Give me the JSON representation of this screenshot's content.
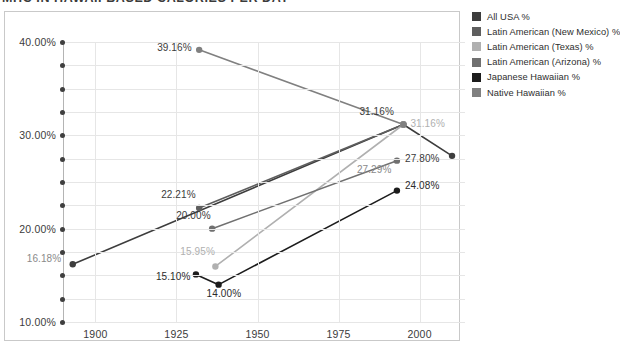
{
  "chart_title": "MHC IN HAWAII BASED CALORIES PER DAY",
  "legend": {
    "position": "right",
    "items": [
      {
        "label": "All USA %",
        "color": "#3d3d3d"
      },
      {
        "label": "Latin American (New Mexico) %",
        "color": "#5e5e5e"
      },
      {
        "label": "Latin American (Texas) %",
        "color": "#b0b0b0"
      },
      {
        "label": "Latin American (Arizona) %",
        "color": "#707070"
      },
      {
        "label": "Japanese Hawaiian %",
        "color": "#1c1c1c"
      },
      {
        "label": "Native Hawaiian %",
        "color": "#808080"
      }
    ]
  },
  "axes": {
    "y_ticks": [
      "10.00%",
      "20.00%",
      "30.00%",
      "40.00%"
    ],
    "y_tick_values": [
      10,
      20,
      30,
      40
    ],
    "x_ticks": [
      "1900",
      "1925",
      "1950",
      "1975",
      "2000"
    ],
    "x_tick_values": [
      1900,
      1925,
      1950,
      1975,
      2000
    ],
    "ylim": [
      10,
      40
    ],
    "xlim": [
      1890,
      2014
    ],
    "ylabel": "",
    "xlabel": ""
  },
  "chart_data": {
    "type": "line",
    "title": "MHC IN HAWAII BASED CALORIES PER DAY",
    "xlabel": "",
    "ylabel": "",
    "xlim": [
      1890,
      2014
    ],
    "ylim": [
      10,
      40
    ],
    "grid": true,
    "legend_position": "right",
    "series": [
      {
        "name": "All USA %",
        "color": "#3d3d3d",
        "points": [
          {
            "x": 1893,
            "y": 16.18,
            "label": "16.18%"
          },
          {
            "x": 1995,
            "y": 31.16,
            "label": "31.16%"
          },
          {
            "x": 2010,
            "y": 27.8,
            "label": "27.80%"
          }
        ]
      },
      {
        "name": "Latin American (New Mexico) %",
        "color": "#5e5e5e",
        "points": [
          {
            "x": 1932,
            "y": 22.21,
            "label": "22.21%"
          },
          {
            "x": 1995,
            "y": 31.16,
            "label": "31.16%"
          }
        ]
      },
      {
        "name": "Latin American (Texas) %",
        "color": "#b0b0b0",
        "points": [
          {
            "x": 1937,
            "y": 15.95,
            "label": "15.95%"
          },
          {
            "x": 1995,
            "y": 31.16,
            "label": "31.16%"
          }
        ]
      },
      {
        "name": "Latin American (Arizona) %",
        "color": "#707070",
        "points": [
          {
            "x": 1936,
            "y": 20.0,
            "label": "20.00%"
          },
          {
            "x": 1993,
            "y": 27.29,
            "label": "27.29%"
          }
        ]
      },
      {
        "name": "Japanese Hawaiian %",
        "color": "#1c1c1c",
        "points": [
          {
            "x": 1931,
            "y": 15.1,
            "label": "15.10%"
          },
          {
            "x": 1938,
            "y": 14.0,
            "label": "14.00%"
          },
          {
            "x": 1993,
            "y": 24.08,
            "label": "24.08%"
          }
        ]
      },
      {
        "name": "Native Hawaiian %",
        "color": "#808080",
        "points": [
          {
            "x": 1932,
            "y": 39.16,
            "label": "39.16%"
          },
          {
            "x": 1995,
            "y": 31.16,
            "label": "31.16%"
          }
        ]
      }
    ],
    "point_labels": [
      {
        "text": "39.16%",
        "x": 1932,
        "y": 39.16,
        "color": "#3b3b3b"
      },
      {
        "text": "31.16%",
        "x": 1995,
        "y": 31.16,
        "color": "#3b3b3b"
      },
      {
        "text": "31.16%",
        "x": 1995,
        "y": 31.16,
        "color": "#b0b0b0"
      },
      {
        "text": "27.80%",
        "x": 2010,
        "y": 27.8,
        "color": "#3b3b3b"
      },
      {
        "text": "27.29%",
        "x": 1993,
        "y": 27.29,
        "color": "#8a8a8a"
      },
      {
        "text": "24.08%",
        "x": 1993,
        "y": 24.08,
        "color": "#2b2b2b"
      },
      {
        "text": "22.21%",
        "x": 1932,
        "y": 22.21,
        "color": "#3b3b3b"
      },
      {
        "text": "20.00%",
        "x": 1936,
        "y": 20.0,
        "color": "#3b3b3b"
      },
      {
        "text": "16.18%",
        "x": 1893,
        "y": 16.18,
        "color": "#8a8a8a"
      },
      {
        "text": "15.95%",
        "x": 1937,
        "y": 15.95,
        "color": "#b0b0b0"
      },
      {
        "text": "15.10%",
        "x": 1931,
        "y": 15.1,
        "color": "#2b2b2b"
      },
      {
        "text": "14.00%",
        "x": 1938,
        "y": 14.0,
        "color": "#2b2b2b"
      }
    ]
  }
}
